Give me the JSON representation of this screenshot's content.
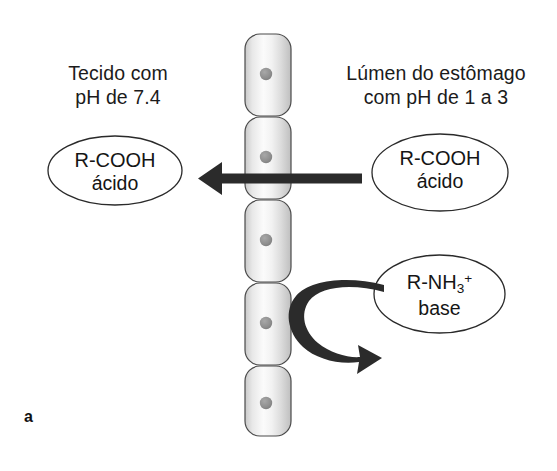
{
  "figure": {
    "panel_label": "a",
    "background_color": "#ffffff",
    "ink_color": "#1a1a1a",
    "arrow_color": "#2b2b2b",
    "nucleus_color": "#8c8c8c"
  },
  "captions": {
    "left": {
      "line1": "Tecido com",
      "line2": "pH de 7.4"
    },
    "right": {
      "line1": "Lúmen do estômago",
      "line2": "com pH de 1 a 3"
    }
  },
  "bubbles": {
    "left_acid": {
      "formula_prefix": "R-COOH",
      "label": "ácido"
    },
    "right_acid": {
      "formula_prefix": "R-COOH",
      "label": "ácido"
    },
    "base": {
      "formula_prefix": "R-NH",
      "formula_sub": "3",
      "formula_sup": "+",
      "label": "base"
    }
  },
  "epithelium": {
    "cell_count": 5,
    "cells": [
      {
        "x": 245,
        "y": 34,
        "w": 46,
        "h": 82
      },
      {
        "x": 245,
        "y": 117,
        "w": 46,
        "h": 82
      },
      {
        "x": 245,
        "y": 200,
        "w": 46,
        "h": 82
      },
      {
        "x": 245,
        "y": 283,
        "w": 46,
        "h": 82
      },
      {
        "x": 245,
        "y": 366,
        "w": 46,
        "h": 70
      }
    ],
    "nuclei": [
      {
        "cx": 266,
        "cy": 74,
        "r": 6
      },
      {
        "cx": 266,
        "cy": 157,
        "r": 6
      },
      {
        "cx": 266,
        "cy": 240,
        "r": 6
      },
      {
        "cx": 266,
        "cy": 323,
        "r": 6
      },
      {
        "cx": 266,
        "cy": 403,
        "r": 6
      }
    ]
  },
  "arrows": {
    "straight": {
      "direction": "left",
      "from_x": 362,
      "to_x": 198,
      "y": 178,
      "thickness": 9
    },
    "curved": {
      "direction": "u-turn-down-right",
      "start_x": 382,
      "start_y": 293,
      "end_x": 368,
      "end_y": 354
    }
  }
}
